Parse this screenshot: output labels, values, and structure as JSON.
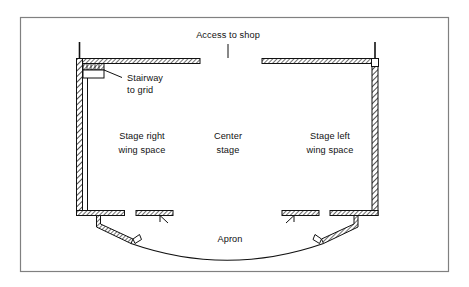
{
  "figure": {
    "type": "floor-plan-diagram",
    "frame": {
      "border_color": "#808080",
      "background": "#ffffff"
    },
    "ink_color": "#111111"
  },
  "labels": {
    "access_to_shop": "Access to shop",
    "stairway_to_grid_line1": "Stairway",
    "stairway_to_grid_line2": "to grid",
    "stage_right_line1": "Stage right",
    "stage_right_line2": "wing space",
    "center_stage_line1": "Center",
    "center_stage_line2": "stage",
    "stage_left_line1": "Stage left",
    "stage_left_line2": "wing space",
    "apron": "Apron"
  },
  "regions": [
    {
      "name": "stage-right-wing-space",
      "label": "Stage right wing space"
    },
    {
      "name": "center-stage",
      "label": "Center stage"
    },
    {
      "name": "stage-left-wing-space",
      "label": "Stage left wing space"
    },
    {
      "name": "apron",
      "label": "Apron"
    }
  ],
  "features": [
    {
      "name": "stairway-to-grid",
      "label": "Stairway to grid"
    },
    {
      "name": "access-to-shop-opening",
      "label": "Access to shop"
    },
    {
      "name": "upstage-wall-left",
      "label": "Upstage wall (stage right)"
    },
    {
      "name": "upstage-wall-right",
      "label": "Upstage wall (stage left)"
    },
    {
      "name": "side-wall-left",
      "label": "Stage right side wall"
    },
    {
      "name": "side-wall-right",
      "label": "Stage left side wall"
    },
    {
      "name": "proscenium-wall-left",
      "label": "Proscenium wall stage right"
    },
    {
      "name": "proscenium-wall-right",
      "label": "Proscenium wall stage left"
    },
    {
      "name": "apron-curve",
      "label": "Apron edge"
    }
  ]
}
